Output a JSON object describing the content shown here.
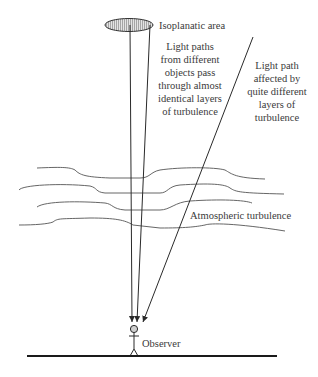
{
  "diagram": {
    "labels": {
      "isoplanatic_area": "Isoplanatic area",
      "near_paths": [
        "Light paths",
        "from different",
        "objects pass",
        "through almost",
        "identical layers",
        "of turbulence"
      ],
      "far_path": [
        "Light path",
        "affected by",
        "quite different",
        "layers of",
        "turbulence"
      ],
      "turbulence": "Atmospheric turbulence",
      "observer": "Observer"
    },
    "colors": {
      "line": "#2a2a2a",
      "turbulence_line": "#555555",
      "ellipse_fill": "#c8c8c8",
      "head_fill": "#cfcfcf",
      "background": "#ffffff"
    }
  }
}
